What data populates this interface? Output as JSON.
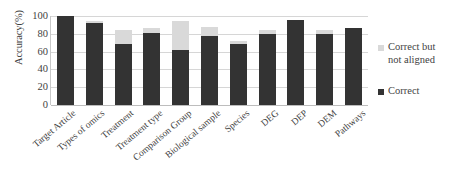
{
  "chart_data": {
    "type": "bar",
    "stacked": true,
    "title": "",
    "xlabel": "",
    "ylabel": "Accuracy(%)",
    "ylim": [
      0,
      100
    ],
    "ytick_step": 20,
    "yticks": [
      100,
      80,
      60,
      40,
      20,
      0
    ],
    "grid": true,
    "legend_position": "right",
    "categories": [
      "Target Article",
      "Types of omics",
      "Treatment",
      "Treatment type",
      "Comparison Group",
      "Biological sample",
      "Species",
      "DEG",
      "DEP",
      "DEM",
      "Pathways"
    ],
    "series": [
      {
        "name": "Correct",
        "color": "#333333",
        "values": [
          100,
          92,
          68,
          81,
          62,
          78,
          68,
          80,
          96,
          80,
          86
        ]
      },
      {
        "name": "Correct but not aligned",
        "color": "#d9d9d9",
        "values": [
          0,
          2,
          16,
          5,
          32,
          10,
          4,
          4,
          0,
          4,
          0
        ]
      }
    ],
    "legend_entries": [
      {
        "label": "Correct but\nnot aligned",
        "color": "#d9d9d9"
      },
      {
        "label": "Correct",
        "color": "#333333"
      }
    ]
  },
  "colors": {
    "correct": "#333333",
    "correct_not_aligned": "#d9d9d9",
    "gridline": "#d6d6d6",
    "axis": "#bdbdbd",
    "text": "#3f3f3f",
    "background": "#ffffff"
  }
}
